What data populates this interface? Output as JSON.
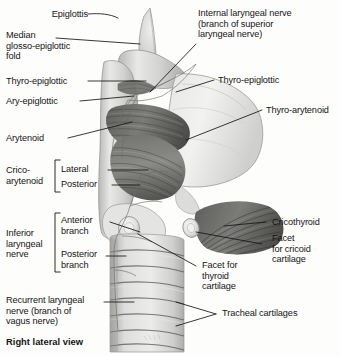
{
  "figure": {
    "title": "Right lateral view",
    "view_caption": "Right lateral view",
    "background_color": "#fdfdfc",
    "ink_color": "#151515",
    "style": "grayscale anatomical illustration"
  },
  "labels": {
    "epiglottis": "Epiglottis",
    "median_glosso_epiglottic_fold": "Median\nglosso-epiglottic\nfold",
    "thyro_epiglottic_left": "Thyro-epiglottic",
    "ary_epiglottic": "Ary-epiglottic",
    "arytenoid": "Arytenoid",
    "crico_arytenoid": "Crico-\narytenoid",
    "crico_arytenoid_lateral": "Lateral",
    "crico_arytenoid_posterior": "Posterior",
    "inferior_laryngeal_nerve": "Inferior\nlaryngeal\nnerve",
    "inferior_anterior_branch": "Anterior\nbranch",
    "inferior_posterior_branch": "Posterior\nbranch",
    "recurrent_laryngeal_nerve": "Recurrent laryngeal\nnerve (branch of\nvagus nerve)",
    "internal_laryngeal_nerve": "Internal laryngeal nerve\n(branch of superior\nlaryngeal nerve)",
    "thyro_epiglottic_right": "Thyro-epiglottic",
    "thyro_arytenoid": "Thyro-arytenoid",
    "cricothyroid": "Cricothyroid",
    "facet_for_cricoid_cartilage": "Facet\nfor cricoid\ncartilage",
    "facet_for_thyroid_cartilage": "Facet for\nthyroid\ncartilage",
    "tracheal_cartilages": "Tracheal cartilages"
  },
  "label_list": [
    {
      "id": "epiglottis",
      "text": "Epiglottis",
      "side": "left"
    },
    {
      "id": "median-glosso-epiglottic-fold",
      "text": "Median glosso-epiglottic fold",
      "side": "left"
    },
    {
      "id": "thyro-epiglottic-left",
      "text": "Thyro-epiglottic",
      "side": "left"
    },
    {
      "id": "ary-epiglottic",
      "text": "Ary-epiglottic",
      "side": "left"
    },
    {
      "id": "arytenoid",
      "text": "Arytenoid",
      "side": "left"
    },
    {
      "id": "crico-arytenoid",
      "text": "Crico-arytenoid",
      "side": "left",
      "sub": [
        "Lateral",
        "Posterior"
      ]
    },
    {
      "id": "inferior-laryngeal-nerve",
      "text": "Inferior laryngeal nerve",
      "side": "left",
      "sub": [
        "Anterior branch",
        "Posterior branch"
      ]
    },
    {
      "id": "recurrent-laryngeal-nerve",
      "text": "Recurrent laryngeal nerve (branch of vagus nerve)",
      "side": "left"
    },
    {
      "id": "internal-laryngeal-nerve",
      "text": "Internal laryngeal nerve (branch of superior laryngeal nerve)",
      "side": "right"
    },
    {
      "id": "thyro-epiglottic-right",
      "text": "Thyro-epiglottic",
      "side": "right"
    },
    {
      "id": "thyro-arytenoid",
      "text": "Thyro-arytenoid",
      "side": "right"
    },
    {
      "id": "cricothyroid",
      "text": "Cricothyroid",
      "side": "right"
    },
    {
      "id": "facet-for-cricoid-cartilage",
      "text": "Facet for cricoid cartilage",
      "side": "right"
    },
    {
      "id": "facet-for-thyroid-cartilage",
      "text": "Facet for thyroid cartilage",
      "side": "right"
    },
    {
      "id": "tracheal-cartilages",
      "text": "Tracheal cartilages",
      "side": "right"
    }
  ]
}
